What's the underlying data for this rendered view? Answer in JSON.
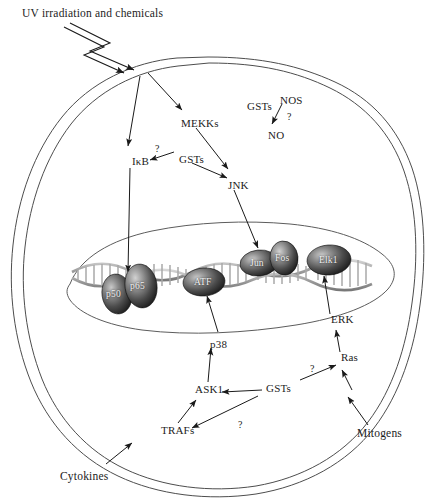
{
  "diagram": {
    "title": "UV irradiation and chemicals",
    "type": "cell-signaling-pathway",
    "colors": {
      "membrane": "#4a4a4a",
      "nucleus": "#5a5a5a",
      "dna": "#9a9a9a",
      "protein_fill_dark": "#2b2b2b",
      "protein_fill_light": "#b0b0b0",
      "protein_text": "#f2f2f2",
      "arrow": "#1a1a1a",
      "background": "#ffffff"
    }
  },
  "stimuli": [
    {
      "id": "uv",
      "label": "UV irradiation and chemicals",
      "x": 22,
      "y": 8
    },
    {
      "id": "cytokines",
      "label": "Cytokines",
      "x": 78,
      "y": 477
    },
    {
      "id": "mitogens",
      "label": "Mitogens",
      "x": 357,
      "y": 432
    }
  ],
  "cytoplasm_nodes": [
    {
      "id": "mekks",
      "label": "MEKKs",
      "x": 181,
      "y": 118
    },
    {
      "id": "ikb",
      "label": "IκB",
      "x": 132,
      "y": 156
    },
    {
      "id": "gsts_upper",
      "label": "GSTs",
      "x": 179,
      "y": 154
    },
    {
      "id": "jnk",
      "label": "JNK",
      "x": 228,
      "y": 180
    },
    {
      "id": "gsts_nos",
      "label": "GSTs",
      "x": 247,
      "y": 101
    },
    {
      "id": "nos",
      "label": "NOS",
      "x": 280,
      "y": 95
    },
    {
      "id": "no",
      "label": "NO",
      "x": 268,
      "y": 130
    },
    {
      "id": "p38",
      "label": "p38",
      "x": 210,
      "y": 339
    },
    {
      "id": "ask1",
      "label": "ASK1",
      "x": 195,
      "y": 390
    },
    {
      "id": "gsts_lower",
      "label": "GSTs",
      "x": 266,
      "y": 388
    },
    {
      "id": "trafs",
      "label": "TRAFs",
      "x": 161,
      "y": 428
    },
    {
      "id": "erk",
      "label": "ERK",
      "x": 331,
      "y": 320
    },
    {
      "id": "ras",
      "label": "Ras",
      "x": 341,
      "y": 358
    }
  ],
  "question_marks": [
    {
      "id": "q-ikb",
      "label": "?",
      "x": 155,
      "y": 146
    },
    {
      "id": "q-nos",
      "label": "?",
      "x": 287,
      "y": 115
    },
    {
      "id": "q-trafs",
      "label": "?",
      "x": 238,
      "y": 424
    },
    {
      "id": "q-ras",
      "label": "?",
      "x": 310,
      "y": 369
    }
  ],
  "nucleus_proteins": [
    {
      "id": "p50",
      "label": "p50",
      "cx": 117,
      "cy": 294,
      "rx": 15,
      "ry": 20,
      "rot": -8
    },
    {
      "id": "p65",
      "label": "p65",
      "cx": 141,
      "cy": 286,
      "rx": 16,
      "ry": 22,
      "rot": -8
    },
    {
      "id": "atf",
      "label": "ATF",
      "cx": 204,
      "cy": 282,
      "rx": 21,
      "ry": 14,
      "rot": -4
    },
    {
      "id": "jun",
      "label": "Jun",
      "cx": 259,
      "cy": 263,
      "rx": 19,
      "ry": 13,
      "rot": -6
    },
    {
      "id": "fos",
      "label": "Fos",
      "cx": 284,
      "cy": 258,
      "rx": 14,
      "ry": 17,
      "rot": -6
    },
    {
      "id": "elk1",
      "label": "Elk1",
      "cx": 329,
      "cy": 260,
      "rx": 22,
      "ry": 15,
      "rot": -4
    }
  ],
  "structures": {
    "membrane_label": "plasma-membrane",
    "nucleus_label": "nucleus-envelope",
    "dna_label": "dna-double-helix"
  }
}
